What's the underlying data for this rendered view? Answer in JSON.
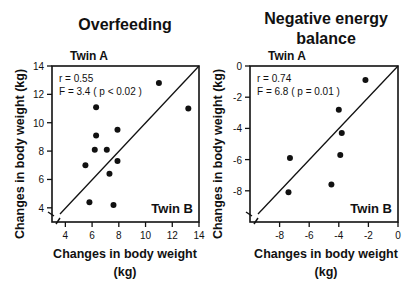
{
  "chart_data": [
    {
      "type": "scatter",
      "title": "Overfeeding",
      "xlabel": "Changes in body weight (kg)",
      "ylabel": "Changes in body weight (kg)",
      "corner_label_top": "Twin A",
      "corner_label_bottom": "Twin B",
      "annotations": [
        "r = 0.55",
        "F = 3.4 ( p < 0.02 )"
      ],
      "xlim": [
        3,
        14
      ],
      "ylim": [
        3,
        14
      ],
      "xticks": [
        4,
        6,
        8,
        10,
        12,
        14
      ],
      "yticks": [
        4,
        6,
        8,
        10,
        12,
        14
      ],
      "identity_line": true,
      "points": [
        [
          6.3,
          11.1
        ],
        [
          11.0,
          12.8
        ],
        [
          13.2,
          11.0
        ],
        [
          6.3,
          9.1
        ],
        [
          7.9,
          9.5
        ],
        [
          6.2,
          8.1
        ],
        [
          7.1,
          8.1
        ],
        [
          5.5,
          7.0
        ],
        [
          7.9,
          7.3
        ],
        [
          7.3,
          6.4
        ],
        [
          5.8,
          4.4
        ],
        [
          7.6,
          4.2
        ]
      ]
    },
    {
      "type": "scatter",
      "title": "Negative energy balance",
      "xlabel": "Changes in body weight (kg)",
      "ylabel": "Changes in body weight (kg)",
      "corner_label_top": "Twin A",
      "corner_label_bottom": "Twin B",
      "annotations": [
        "r = 0.74",
        "F = 6.8 ( p = 0.01 )"
      ],
      "xlim": [
        -10,
        0
      ],
      "ylim": [
        -10,
        0
      ],
      "xticks": [
        -8,
        -6,
        -4,
        -2,
        0
      ],
      "yticks": [
        -8,
        -6,
        -4,
        -2,
        0
      ],
      "identity_line": true,
      "points": [
        [
          -2.2,
          -0.9
        ],
        [
          -4.0,
          -2.8
        ],
        [
          -3.8,
          -4.3
        ],
        [
          -3.9,
          -5.7
        ],
        [
          -7.3,
          -5.9
        ],
        [
          -4.5,
          -7.6
        ],
        [
          -7.4,
          -8.1
        ]
      ]
    }
  ]
}
